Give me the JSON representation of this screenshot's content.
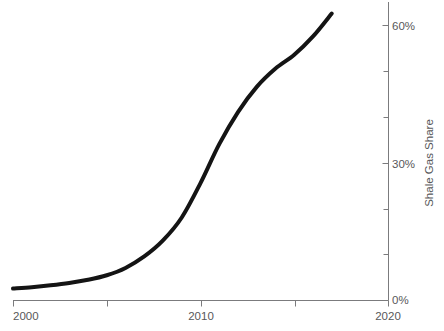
{
  "chart_data": {
    "type": "line",
    "title": "",
    "subtitle": "",
    "xlabel": "",
    "ylabel": "Shale Gas Share",
    "xlim": [
      2000,
      2020
    ],
    "ylim": [
      0,
      65
    ],
    "grid": false,
    "legend": null,
    "x_tick_values": [
      2000,
      2005,
      2010,
      2015,
      2020
    ],
    "x_tick_labels": [
      "2000",
      "",
      "2010",
      "",
      "2020"
    ],
    "x_axis_labels": [
      "2000",
      "2010",
      "2020"
    ],
    "y_tick_values": [
      0,
      10,
      20,
      30,
      40,
      50,
      60
    ],
    "y_tick_labels": [
      "0%",
      "",
      "",
      "30%",
      "",
      "",
      "60%"
    ],
    "y_axis_labels": [
      "0%",
      "30%",
      "60%"
    ],
    "series": [
      {
        "name": "Shale Gas Share",
        "color": "#141414",
        "line_width": 4,
        "x": [
          2000,
          2001,
          2002,
          2003,
          2004,
          2005,
          2006,
          2007,
          2008,
          2009,
          2010,
          2011,
          2012,
          2013,
          2014,
          2015,
          2016,
          2017
        ],
        "values": [
          2.5,
          2.8,
          3.2,
          3.7,
          4.4,
          5.4,
          7.0,
          9.5,
          13.0,
          18.0,
          25.5,
          34.0,
          41.0,
          46.5,
          50.5,
          53.5,
          57.5,
          62.5
        ]
      }
    ]
  },
  "axes": {
    "y_axis_title": "Shale Gas Share",
    "x_labels": [
      {
        "text": "2000",
        "value": 2000
      },
      {
        "text": "2010",
        "value": 2010
      },
      {
        "text": "2020",
        "value": 2020
      }
    ],
    "y_labels": [
      {
        "text": "0%",
        "value": 0
      },
      {
        "text": "30%",
        "value": 30
      },
      {
        "text": "60%",
        "value": 60
      }
    ]
  },
  "colors": {
    "line": "#141414",
    "axis": "#7b7b7d",
    "text": "#58585a",
    "background": "#ffffff"
  }
}
